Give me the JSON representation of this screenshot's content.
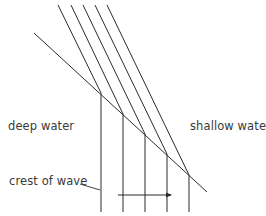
{
  "diagram": {
    "labels": {
      "deep_water": "deep water",
      "shallow_water": "shallow water",
      "crest_of_wave": "crest of wave"
    },
    "colors": {
      "line": "#2b2b2b",
      "text": "#3a3a3a",
      "background": "#ffffff"
    },
    "boundary": {
      "x1": 34,
      "y1": 33,
      "x2": 207,
      "y2": 192
    },
    "wave_crests": [
      {
        "top_x": 58,
        "top_y": 5,
        "hit_x": 101,
        "hit_y": 93,
        "bottom_y": 212
      },
      {
        "top_x": 71,
        "top_y": 5,
        "hit_x": 123,
        "hit_y": 114,
        "bottom_y": 212
      },
      {
        "top_x": 83,
        "top_y": 5,
        "hit_x": 145,
        "hit_y": 134,
        "bottom_y": 212
      },
      {
        "top_x": 95,
        "top_y": 5,
        "hit_x": 167,
        "hit_y": 154,
        "bottom_y": 212
      },
      {
        "top_x": 107,
        "top_y": 5,
        "hit_x": 189,
        "hit_y": 175,
        "bottom_y": 212
      }
    ],
    "direction_arrow": {
      "x1": 118,
      "y1": 195,
      "x2": 172,
      "y2": 195
    },
    "leader_line": {
      "x1": 80,
      "y1": 184,
      "x2": 100,
      "y2": 190
    }
  }
}
